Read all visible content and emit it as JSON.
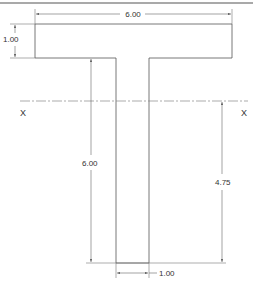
{
  "drawing": {
    "type": "T-section cross-section",
    "units_shown": "none",
    "dimensions": {
      "flange_width": "6.00",
      "flange_thickness": "1.00",
      "web_height": "6.00",
      "web_width": "1.00",
      "centroid_height": "4.75"
    },
    "axis": {
      "left_label": "X",
      "right_label": "X"
    },
    "colors": {
      "outline": "#555555",
      "dimension": "#666666",
      "centerline": "#888888",
      "text": "#333333"
    }
  }
}
